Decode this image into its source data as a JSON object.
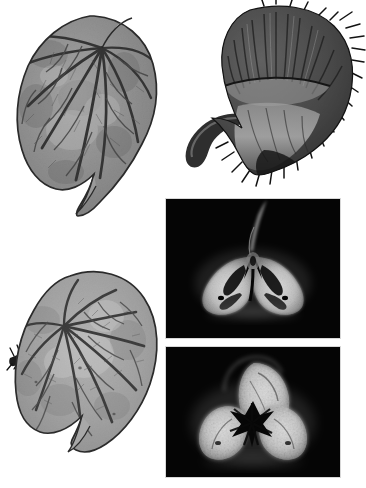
{
  "figure": {
    "type": "botanical-specimen-plate",
    "background_color": "#ffffff",
    "width": 366,
    "height": 488,
    "color_mode": "grayscale",
    "panel_count": 5,
    "caption": ""
  },
  "panels": [
    {
      "id": "panel-leaf-adaxial",
      "name": "leaf-adaxial-surface",
      "subject": "cordate leaf, upper (adaxial) surface",
      "position": {
        "x": 14,
        "y": 6,
        "width": 146,
        "height": 218
      },
      "background_color": "#ffffff",
      "lamina_fill": "#8f8f8f",
      "vein_color": "#3a3a3a",
      "outline_color": "#2b2b2b",
      "notes": "asymmetric cordate blade, palmate venation, acuminate drip tip lower right, basal sinus at upper right",
      "vein_count": 9
    },
    {
      "id": "panel-fruit-whole",
      "name": "fruit-capsule-whole",
      "subject": "hairy winged capsule with curved pedicel",
      "position": {
        "x": 178,
        "y": 4,
        "width": 182,
        "height": 190
      },
      "background_color": "#ffffff",
      "body_fill": "#4a4a4a",
      "body_fill_dark": "#262626",
      "highlight_fill": "#b9b9b9",
      "trichome_color": "#1a1a1a",
      "notes": "broad dorsal wing with radial striations, curved pedicel extending to the left, dense marginal trichomes on the right margin",
      "trichome_count": 26
    },
    {
      "id": "panel-section-upper",
      "name": "fruit-cross-section-upper",
      "subject": "dark-field transverse section of capsule, two locules",
      "position": {
        "x": 166,
        "y": 199,
        "width": 174,
        "height": 139
      },
      "background_color": "#050505",
      "tissue_fill": "#e6e6e6",
      "tissue_mid": "#9a9a9a",
      "lumen_color": "#070707",
      "border_color": "#d8d8d8",
      "notes": "bilobed placental mass, central style canal rising to top, dark locule slits inside each lobe",
      "lobe_count": 2
    },
    {
      "id": "panel-section-lower",
      "name": "fruit-cross-section-lower",
      "subject": "dark-field transverse section of capsule, three lobes with stellate placenta",
      "position": {
        "x": 166,
        "y": 347,
        "width": 174,
        "height": 130
      },
      "background_color": "#050505",
      "tissue_fill": "#ededed",
      "tissue_mid": "#a6a6a6",
      "lumen_color": "#060606",
      "border_color": "#d8d8d8",
      "notes": "three swollen seed-bearing lobes around a dark stellate central placenta, granular seed texture",
      "lobe_count": 3
    },
    {
      "id": "panel-leaf-abaxial",
      "name": "leaf-abaxial-surface",
      "subject": "cordate leaf, lower (abaxial) surface with hairy petiole",
      "position": {
        "x": 10,
        "y": 256,
        "width": 152,
        "height": 212
      },
      "background_color": "#ffffff",
      "lamina_fill": "#9d9d9d",
      "vein_color": "#3f3f3f",
      "outline_color": "#2b2b2b",
      "petiole_color": "#1c1c1c",
      "notes": "paler abaxial lamina, prominent raised reticulate venation, dark hispid petiole entering from the left, acuminate tip at lower centre",
      "vein_count": 10
    }
  ]
}
